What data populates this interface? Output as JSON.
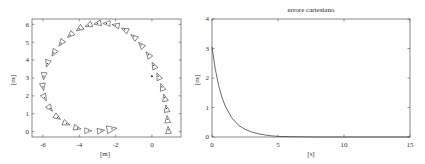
{
  "chart_data": [
    {
      "type": "scatter",
      "title": "",
      "xlabel": "[m]",
      "ylabel": "[m]",
      "xlim": [
        -6.6,
        1.6
      ],
      "ylim": [
        -0.3,
        6.3
      ],
      "xticks": [
        -6,
        -4,
        -2,
        0
      ],
      "yticks": [
        0,
        1,
        2,
        3,
        4,
        5,
        6
      ],
      "grid": false,
      "marker": "triangle (robot pose, oriented along heading)",
      "series": [
        {
          "name": "trajectory",
          "x": [
            0.9,
            0.85,
            0.8,
            0.7,
            0.55,
            0.35,
            0.1,
            -0.2,
            -0.6,
            -1.0,
            -1.5,
            -2.0,
            -2.5,
            -3.0,
            -3.5,
            -4.0,
            -4.5,
            -5.0,
            -5.4,
            -5.75,
            -5.95,
            -6.0,
            -5.9,
            -5.6,
            -5.2,
            -4.7,
            -4.1,
            -3.5,
            -2.8,
            -2.2
          ],
          "y": [
            0.1,
            0.7,
            1.3,
            1.9,
            2.5,
            3.1,
            3.7,
            4.3,
            4.85,
            5.3,
            5.7,
            5.95,
            6.05,
            6.05,
            5.95,
            5.75,
            5.4,
            4.95,
            4.4,
            3.8,
            3.1,
            2.5,
            1.9,
            1.3,
            0.8,
            0.45,
            0.2,
            0.05,
            0.05,
            0.15
          ]
        }
      ],
      "annotations": [
        {
          "type": "dot",
          "x": 0.0,
          "y": 3.1
        }
      ]
    },
    {
      "type": "line",
      "title": "errore cartesiano",
      "xlabel": "[s]",
      "ylabel": "[m]",
      "xlim": [
        0,
        15
      ],
      "ylim": [
        0,
        4
      ],
      "xticks": [
        0,
        5,
        10,
        15
      ],
      "yticks": [
        0,
        1,
        2,
        3,
        4
      ],
      "grid": false,
      "series": [
        {
          "name": "errore cartesiano",
          "x": [
            0,
            0.25,
            0.5,
            0.75,
            1,
            1.5,
            2,
            2.5,
            3,
            3.5,
            4,
            4.5,
            5,
            6,
            8,
            10,
            15
          ],
          "y": [
            3.05,
            2.3,
            1.75,
            1.35,
            1.05,
            0.65,
            0.4,
            0.26,
            0.17,
            0.11,
            0.07,
            0.04,
            0.02,
            0.01,
            0.0,
            0.0,
            0.0
          ]
        }
      ]
    }
  ],
  "left_plot": {
    "xlabel": "[m]",
    "ylabel": "[m]",
    "xticks": [
      "-6",
      "-4",
      "-2",
      "0"
    ],
    "yticks": [
      "0",
      "1",
      "2",
      "3",
      "4",
      "5",
      "6"
    ]
  },
  "right_plot": {
    "title": "errore cartesiano",
    "xlabel": "[s]",
    "ylabel": "[m]",
    "xticks": [
      "0",
      "5",
      "10",
      "15"
    ],
    "yticks": [
      "0",
      "1",
      "2",
      "3",
      "4"
    ]
  }
}
